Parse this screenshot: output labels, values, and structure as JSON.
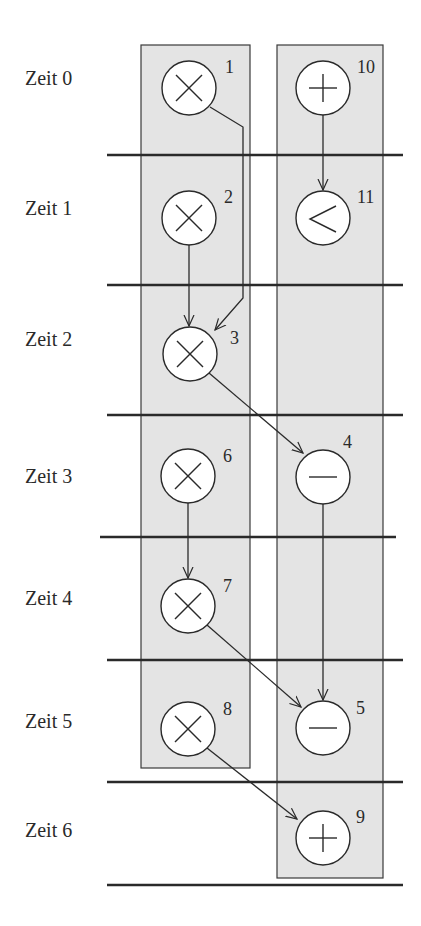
{
  "diagram": {
    "time_labels": [
      "Zeit 0",
      "Zeit 1",
      "Zeit 2",
      "Zeit 3",
      "Zeit 4",
      "Zeit 5",
      "Zeit 6"
    ],
    "nodes": [
      {
        "id": "1",
        "op": "multiply",
        "column": "left",
        "time": 0
      },
      {
        "id": "10",
        "op": "add",
        "column": "right",
        "time": 0
      },
      {
        "id": "2",
        "op": "multiply",
        "column": "left",
        "time": 1
      },
      {
        "id": "11",
        "op": "less-than",
        "column": "right",
        "time": 1
      },
      {
        "id": "3",
        "op": "multiply",
        "column": "left",
        "time": 2
      },
      {
        "id": "6",
        "op": "multiply",
        "column": "left",
        "time": 3
      },
      {
        "id": "4",
        "op": "subtract",
        "column": "right",
        "time": 3
      },
      {
        "id": "7",
        "op": "multiply",
        "column": "left",
        "time": 4
      },
      {
        "id": "8",
        "op": "multiply",
        "column": "left",
        "time": 5
      },
      {
        "id": "5",
        "op": "subtract",
        "column": "right",
        "time": 5
      },
      {
        "id": "9",
        "op": "add",
        "column": "right",
        "time": 6
      }
    ],
    "edges": [
      {
        "from": "1",
        "to": "3"
      },
      {
        "from": "10",
        "to": "11"
      },
      {
        "from": "2",
        "to": "3"
      },
      {
        "from": "3",
        "to": "4"
      },
      {
        "from": "6",
        "to": "7"
      },
      {
        "from": "4",
        "to": "5"
      },
      {
        "from": "7",
        "to": "5"
      },
      {
        "from": "8",
        "to": "9"
      }
    ],
    "colors": {
      "line": "#2a2a2a",
      "box_fill": "#e4e4e4",
      "node_fill": "#ffffff"
    }
  }
}
